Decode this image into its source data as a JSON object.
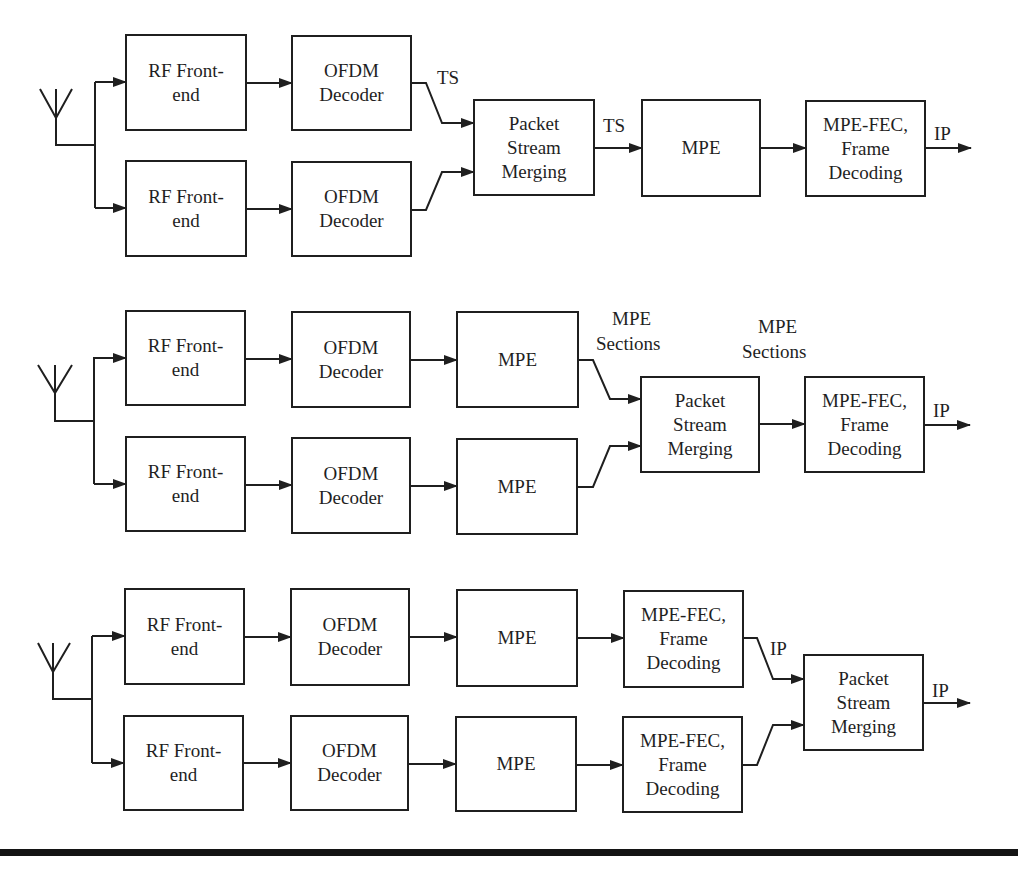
{
  "figure": {
    "stroke_color": "#1f1f1f",
    "background": "#ffffff",
    "diagrams": [
      {
        "id": "diagram-1",
        "description": "Packet stream merging at TS level",
        "antenna": {
          "apex": [
            56,
            118
          ],
          "left": [
            40,
            89
          ],
          "right": [
            72,
            89
          ],
          "stem_bottom": 145,
          "bus_x": 95,
          "bus_top": 82,
          "bus_bottom": 208
        },
        "blocks": [
          {
            "id": "rf-frontend-a",
            "lines": [
              "RF Front-",
              "end"
            ],
            "x": 126,
            "y": 35,
            "w": 120,
            "h": 95
          },
          {
            "id": "rf-frontend-b",
            "lines": [
              "RF Front-",
              "end"
            ],
            "x": 126,
            "y": 161,
            "w": 120,
            "h": 95
          },
          {
            "id": "ofdm-decoder-a",
            "lines": [
              "OFDM",
              "Decoder"
            ],
            "x": 292,
            "y": 36,
            "w": 119,
            "h": 94
          },
          {
            "id": "ofdm-decoder-b",
            "lines": [
              "OFDM",
              "Decoder"
            ],
            "x": 292,
            "y": 162,
            "w": 119,
            "h": 94
          },
          {
            "id": "packet-stream-merging",
            "lines": [
              "Packet",
              "Stream",
              "Merging"
            ],
            "x": 474,
            "y": 100,
            "w": 120,
            "h": 95
          },
          {
            "id": "mpe",
            "lines": [
              "MPE"
            ],
            "x": 642,
            "y": 100,
            "w": 118,
            "h": 96
          },
          {
            "id": "mpe-fec-frame-decoding",
            "lines": [
              "MPE-FEC,",
              "Frame",
              "Decoding"
            ],
            "x": 806,
            "y": 101,
            "w": 119,
            "h": 95
          }
        ],
        "wires": [
          {
            "points": [
              [
                95,
                82
              ],
              [
                126,
                82
              ]
            ],
            "arrow": true
          },
          {
            "points": [
              [
                95,
                208
              ],
              [
                126,
                208
              ]
            ],
            "arrow": true
          },
          {
            "points": [
              [
                246,
                83
              ],
              [
                292,
                83
              ]
            ],
            "arrow": true
          },
          {
            "points": [
              [
                246,
                209
              ],
              [
                292,
                209
              ]
            ],
            "arrow": true
          },
          {
            "points": [
              [
                411,
                83
              ],
              [
                426,
                83
              ],
              [
                442,
                123
              ],
              [
                474,
                123
              ]
            ],
            "arrow": true
          },
          {
            "points": [
              [
                411,
                210
              ],
              [
                426,
                210
              ],
              [
                442,
                172
              ],
              [
                474,
                172
              ]
            ],
            "arrow": true
          },
          {
            "points": [
              [
                594,
                148
              ],
              [
                642,
                148
              ]
            ],
            "arrow": true
          },
          {
            "points": [
              [
                760,
                148
              ],
              [
                806,
                148
              ]
            ],
            "arrow": true
          },
          {
            "points": [
              [
                925,
                148
              ],
              [
                971,
                148
              ]
            ],
            "arrow": true
          }
        ],
        "labels": [
          {
            "text": "TS",
            "x": 437,
            "y": 84
          },
          {
            "text": "TS",
            "x": 603,
            "y": 132
          },
          {
            "text": "IP",
            "x": 934,
            "y": 140
          }
        ]
      },
      {
        "id": "diagram-2",
        "description": "Packet stream merging at MPE section level",
        "antenna": {
          "apex": [
            55,
            393
          ],
          "left": [
            38,
            365
          ],
          "right": [
            72,
            365
          ],
          "stem_bottom": 421,
          "bus_x": 94,
          "bus_top": 357,
          "bus_bottom": 484
        },
        "blocks": [
          {
            "id": "rf-frontend-a",
            "lines": [
              "RF Front-",
              "end"
            ],
            "x": 126,
            "y": 311,
            "w": 119,
            "h": 94
          },
          {
            "id": "rf-frontend-b",
            "lines": [
              "RF Front-",
              "end"
            ],
            "x": 126,
            "y": 437,
            "w": 119,
            "h": 94
          },
          {
            "id": "ofdm-decoder-a",
            "lines": [
              "OFDM",
              "Decoder"
            ],
            "x": 292,
            "y": 312,
            "w": 118,
            "h": 95
          },
          {
            "id": "ofdm-decoder-b",
            "lines": [
              "OFDM",
              "Decoder"
            ],
            "x": 292,
            "y": 438,
            "w": 118,
            "h": 95
          },
          {
            "id": "mpe-a",
            "lines": [
              "MPE"
            ],
            "x": 457,
            "y": 312,
            "w": 121,
            "h": 95
          },
          {
            "id": "mpe-b",
            "lines": [
              "MPE"
            ],
            "x": 457,
            "y": 439,
            "w": 120,
            "h": 95
          },
          {
            "id": "packet-stream-merging",
            "lines": [
              "Packet",
              "Stream",
              "Merging"
            ],
            "x": 641,
            "y": 377,
            "w": 118,
            "h": 95
          },
          {
            "id": "mpe-fec-frame-decoding",
            "lines": [
              "MPE-FEC,",
              "Frame",
              "Decoding"
            ],
            "x": 805,
            "y": 377,
            "w": 119,
            "h": 95
          }
        ],
        "wires": [
          {
            "points": [
              [
                94,
                358
              ],
              [
                126,
                358
              ]
            ],
            "arrow": true
          },
          {
            "points": [
              [
                94,
                484
              ],
              [
                126,
                484
              ]
            ],
            "arrow": true
          },
          {
            "points": [
              [
                245,
                359
              ],
              [
                292,
                359
              ]
            ],
            "arrow": true
          },
          {
            "points": [
              [
                245,
                485
              ],
              [
                292,
                485
              ]
            ],
            "arrow": true
          },
          {
            "points": [
              [
                410,
                360
              ],
              [
                457,
                360
              ]
            ],
            "arrow": true
          },
          {
            "points": [
              [
                410,
                486
              ],
              [
                457,
                486
              ]
            ],
            "arrow": true
          },
          {
            "points": [
              [
                578,
                360
              ],
              [
                593,
                360
              ],
              [
                610,
                399
              ],
              [
                641,
                399
              ]
            ],
            "arrow": true
          },
          {
            "points": [
              [
                577,
                487
              ],
              [
                593,
                487
              ],
              [
                610,
                446
              ],
              [
                641,
                446
              ]
            ],
            "arrow": true
          },
          {
            "points": [
              [
                759,
                424
              ],
              [
                805,
                424
              ]
            ],
            "arrow": true
          },
          {
            "points": [
              [
                924,
                425
              ],
              [
                970,
                425
              ]
            ],
            "arrow": true
          }
        ],
        "labels": [
          {
            "text": "MPE",
            "x": 612,
            "y": 325
          },
          {
            "text": "Sections",
            "x": 596,
            "y": 350
          },
          {
            "text": "MPE",
            "x": 758,
            "y": 333
          },
          {
            "text": "Sections",
            "x": 742,
            "y": 358
          },
          {
            "text": "IP",
            "x": 933,
            "y": 417
          }
        ]
      },
      {
        "id": "diagram-3",
        "description": "Packet stream merging at IP level",
        "antenna": {
          "apex": [
            53,
            672
          ],
          "left": [
            38,
            643
          ],
          "right": [
            70,
            643
          ],
          "stem_bottom": 699,
          "bus_x": 92,
          "bus_top": 636,
          "bus_bottom": 763
        },
        "blocks": [
          {
            "id": "rf-frontend-a",
            "lines": [
              "RF Front-",
              "end"
            ],
            "x": 125,
            "y": 589,
            "w": 119,
            "h": 95
          },
          {
            "id": "rf-frontend-b",
            "lines": [
              "RF Front-",
              "end"
            ],
            "x": 124,
            "y": 716,
            "w": 119,
            "h": 94
          },
          {
            "id": "ofdm-decoder-a",
            "lines": [
              "OFDM",
              "Decoder"
            ],
            "x": 291,
            "y": 589,
            "w": 118,
            "h": 96
          },
          {
            "id": "ofdm-decoder-b",
            "lines": [
              "OFDM",
              "Decoder"
            ],
            "x": 291,
            "y": 716,
            "w": 117,
            "h": 94
          },
          {
            "id": "mpe-a",
            "lines": [
              "MPE"
            ],
            "x": 457,
            "y": 590,
            "w": 120,
            "h": 96
          },
          {
            "id": "mpe-b",
            "lines": [
              "MPE"
            ],
            "x": 456,
            "y": 717,
            "w": 120,
            "h": 94
          },
          {
            "id": "mpe-fec-frame-decoding-a",
            "lines": [
              "MPE-FEC,",
              "Frame",
              "Decoding"
            ],
            "x": 624,
            "y": 591,
            "w": 119,
            "h": 96
          },
          {
            "id": "mpe-fec-frame-decoding-b",
            "lines": [
              "MPE-FEC,",
              "Frame",
              "Decoding"
            ],
            "x": 623,
            "y": 717,
            "w": 119,
            "h": 95
          },
          {
            "id": "packet-stream-merging",
            "lines": [
              "Packet",
              "Stream",
              "Merging"
            ],
            "x": 804,
            "y": 655,
            "w": 119,
            "h": 95
          }
        ],
        "wires": [
          {
            "points": [
              [
                92,
                636
              ],
              [
                125,
                636
              ]
            ],
            "arrow": true
          },
          {
            "points": [
              [
                92,
                763
              ],
              [
                124,
                763
              ]
            ],
            "arrow": true
          },
          {
            "points": [
              [
                244,
                637
              ],
              [
                291,
                637
              ]
            ],
            "arrow": true
          },
          {
            "points": [
              [
                243,
                763
              ],
              [
                291,
                763
              ]
            ],
            "arrow": true
          },
          {
            "points": [
              [
                409,
                637
              ],
              [
                457,
                637
              ]
            ],
            "arrow": true
          },
          {
            "points": [
              [
                408,
                764
              ],
              [
                456,
                764
              ]
            ],
            "arrow": true
          },
          {
            "points": [
              [
                577,
                638
              ],
              [
                624,
                638
              ]
            ],
            "arrow": true
          },
          {
            "points": [
              [
                576,
                765
              ],
              [
                623,
                765
              ]
            ],
            "arrow": true
          },
          {
            "points": [
              [
                743,
                638
              ],
              [
                757,
                638
              ],
              [
                773,
                679
              ],
              [
                804,
                679
              ]
            ],
            "arrow": true
          },
          {
            "points": [
              [
                742,
                765
              ],
              [
                757,
                765
              ],
              [
                773,
                725
              ],
              [
                804,
                725
              ]
            ],
            "arrow": true
          },
          {
            "points": [
              [
                923,
                703
              ],
              [
                970,
                703
              ]
            ],
            "arrow": true
          }
        ],
        "labels": [
          {
            "text": "IP",
            "x": 770,
            "y": 655
          },
          {
            "text": "IP",
            "x": 932,
            "y": 697
          }
        ]
      }
    ],
    "bottom_rule": {
      "y": 849,
      "height": 7
    }
  }
}
